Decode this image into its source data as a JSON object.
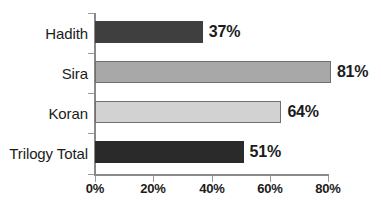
{
  "chart_data": {
    "type": "bar",
    "orientation": "horizontal",
    "title": "",
    "subtitle": "",
    "xlabel": "",
    "ylabel": "",
    "categories": [
      "Hadith",
      "Sira",
      "Koran",
      "Trilogy Total"
    ],
    "values": [
      37,
      81,
      64,
      51
    ],
    "value_labels": [
      "37%",
      "81%",
      "64%",
      "51%"
    ],
    "xlim": [
      0,
      80
    ],
    "xticks": [
      0,
      20,
      40,
      60,
      80
    ],
    "xtick_labels": [
      "0%",
      "20%",
      "40%",
      "60%",
      "80%"
    ],
    "grid": false,
    "legend": "none",
    "series": [
      {
        "name": "Percent",
        "values": [
          37,
          81,
          64,
          51
        ]
      }
    ],
    "bar_colors": [
      "#3f3f3f",
      "#a8a8a8",
      "#d2d2d2",
      "#2a2a2a"
    ],
    "bar_border_colors": [
      "none",
      "#6f6f6f",
      "#6f6f6f",
      "none"
    ],
    "axis_color": "#8a8a8a",
    "text_color": "#1c1c1c",
    "background_color": "#ffffff"
  },
  "bars": [
    {
      "category": "Hadith",
      "value": 37,
      "label": "37%"
    },
    {
      "category": "Sira",
      "value": 81,
      "label": "81%"
    },
    {
      "category": "Koran",
      "value": 64,
      "label": "64%"
    },
    {
      "category": "Trilogy Total",
      "value": 51,
      "label": "51%"
    }
  ],
  "axis": {
    "ticks": [
      {
        "label": "0%"
      },
      {
        "label": "20%"
      },
      {
        "label": "40%"
      },
      {
        "label": "60%"
      },
      {
        "label": "80%"
      }
    ]
  }
}
